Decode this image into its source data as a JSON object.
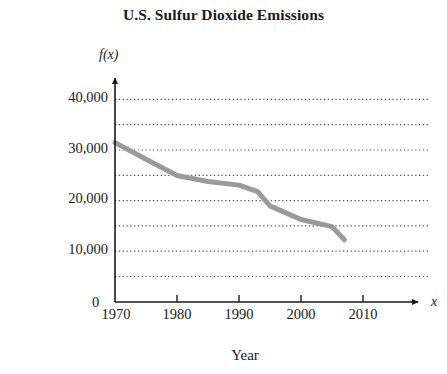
{
  "chart_data": {
    "type": "line",
    "title": "U.S. Sulfur Dioxide Emissions",
    "xlabel": "Year",
    "ylabel_line1": "SO2 Emissions",
    "ylabel_line2": "(in thousands of tons)",
    "y_axis_variable": "f(x)",
    "x_axis_variable": "x",
    "xlim": [
      1970,
      2013
    ],
    "ylim": [
      0,
      42000
    ],
    "x_ticks": [
      1970,
      1980,
      1990,
      2000,
      2010
    ],
    "x_tick_labels": [
      "1970",
      "1980",
      "1990",
      "2000",
      "2010"
    ],
    "y_ticks": [
      0,
      10000,
      20000,
      30000,
      40000
    ],
    "y_tick_labels": [
      "0",
      "10,000",
      "20,000",
      "30,000",
      "40,000"
    ],
    "gridlines_y": [
      5000,
      10000,
      15000,
      20000,
      25000,
      30000,
      35000,
      40000
    ],
    "grid": "horizontal dotted",
    "legend": "none",
    "origin_label": "0",
    "series": [
      {
        "name": "SO2 Emissions",
        "color": "#9a9a9a",
        "line_width": 5,
        "x": [
          1970,
          1975,
          1980,
          1985,
          1990,
          1993,
          1995,
          2000,
          2005,
          2007
        ],
        "values": [
          31500,
          28200,
          25000,
          23800,
          23100,
          21800,
          19000,
          16300,
          14900,
          12300
        ]
      }
    ]
  },
  "axis_geometry": {
    "x_pixel_1970": 115,
    "x_pixel_per_decade": 62,
    "y_pixel_zero": 302,
    "y_pixel_per_5000": 25.3,
    "grid_right_edge": 428
  }
}
